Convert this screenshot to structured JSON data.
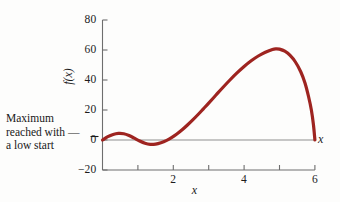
{
  "chart_data": {
    "type": "line",
    "title": "",
    "subtitle": "",
    "xlabel": "x",
    "ylabel": "f(x)",
    "xlim": [
      0,
      6
    ],
    "ylim": [
      -20,
      80
    ],
    "grid": false,
    "legend": null,
    "series": [
      {
        "name": "f(x)",
        "color": "#9e2420",
        "linewidth": 3.2,
        "points": [
          [
            0.0,
            0.0
          ],
          [
            0.15,
            2.2
          ],
          [
            0.3,
            3.7
          ],
          [
            0.45,
            4.4
          ],
          [
            0.6,
            4.2
          ],
          [
            0.75,
            3.0
          ],
          [
            0.9,
            1.2
          ],
          [
            1.05,
            -0.7
          ],
          [
            1.2,
            -2.2
          ],
          [
            1.35,
            -2.9
          ],
          [
            1.5,
            -2.7
          ],
          [
            1.65,
            -1.8
          ],
          [
            1.8,
            -0.4
          ],
          [
            1.95,
            1.6
          ],
          [
            2.1,
            4.0
          ],
          [
            2.25,
            6.8
          ],
          [
            2.4,
            10.0
          ],
          [
            2.55,
            13.4
          ],
          [
            2.7,
            17.0
          ],
          [
            2.85,
            20.8
          ],
          [
            3.0,
            24.6
          ],
          [
            3.2,
            29.8
          ],
          [
            3.4,
            35.0
          ],
          [
            3.6,
            40.0
          ],
          [
            3.8,
            44.7
          ],
          [
            4.0,
            49.0
          ],
          [
            4.2,
            52.8
          ],
          [
            4.4,
            56.0
          ],
          [
            4.6,
            58.5
          ],
          [
            4.8,
            60.4
          ],
          [
            4.9,
            60.8
          ],
          [
            5.0,
            60.6
          ],
          [
            5.15,
            59.2
          ],
          [
            5.3,
            56.4
          ],
          [
            5.45,
            52.0
          ],
          [
            5.6,
            45.5
          ],
          [
            5.72,
            38.0
          ],
          [
            5.82,
            29.0
          ],
          [
            5.9,
            20.0
          ],
          [
            5.96,
            10.0
          ],
          [
            6.0,
            0.0
          ]
        ]
      }
    ],
    "x_ticks": [
      {
        "value": 0,
        "label": ""
      },
      {
        "value": 1,
        "label": ""
      },
      {
        "value": 2,
        "label": "2"
      },
      {
        "value": 3,
        "label": ""
      },
      {
        "value": 4,
        "label": "4"
      },
      {
        "value": 5,
        "label": ""
      },
      {
        "value": 6,
        "label": "6"
      }
    ],
    "y_ticks": [
      {
        "value": 80,
        "label": "80"
      },
      {
        "value": 60,
        "label": "60"
      },
      {
        "value": 40,
        "label": "40"
      },
      {
        "value": 20,
        "label": "20"
      },
      {
        "value": 0,
        "label": "0"
      },
      {
        "value": -20,
        "label": "−20"
      }
    ],
    "annotations": [
      {
        "name": "maximum-note",
        "lines": [
          "Maximum",
          "reached with —",
          "a low start"
        ],
        "target_x": 0,
        "target_y": 0
      }
    ],
    "zero_line": {
      "value": 0,
      "color": "#8a8a8a",
      "from_x": 0,
      "to_x": 6
    }
  },
  "axis_colors": {
    "axis_line": "#6e6e6e",
    "zero_line": "#8f8f8f",
    "curve": "#9e2420",
    "text": "#1a1a1a",
    "background": "#fdfdfc"
  },
  "axis_titles": {
    "x_right": "x",
    "x_bottom": "x",
    "y": "f(x)"
  }
}
